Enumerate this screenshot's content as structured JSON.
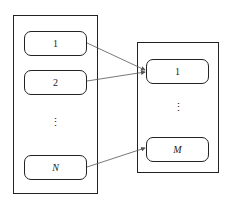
{
  "left_group": {
    "nodes": [
      {
        "label": "1"
      },
      {
        "label": "2"
      },
      {
        "label": "N"
      }
    ],
    "ellipsis": "⋮"
  },
  "right_group": {
    "nodes": [
      {
        "label": "1"
      },
      {
        "label": "M"
      }
    ],
    "ellipsis": "⋮"
  },
  "colors": {
    "stroke": "#222222",
    "arrow": "#555555"
  }
}
